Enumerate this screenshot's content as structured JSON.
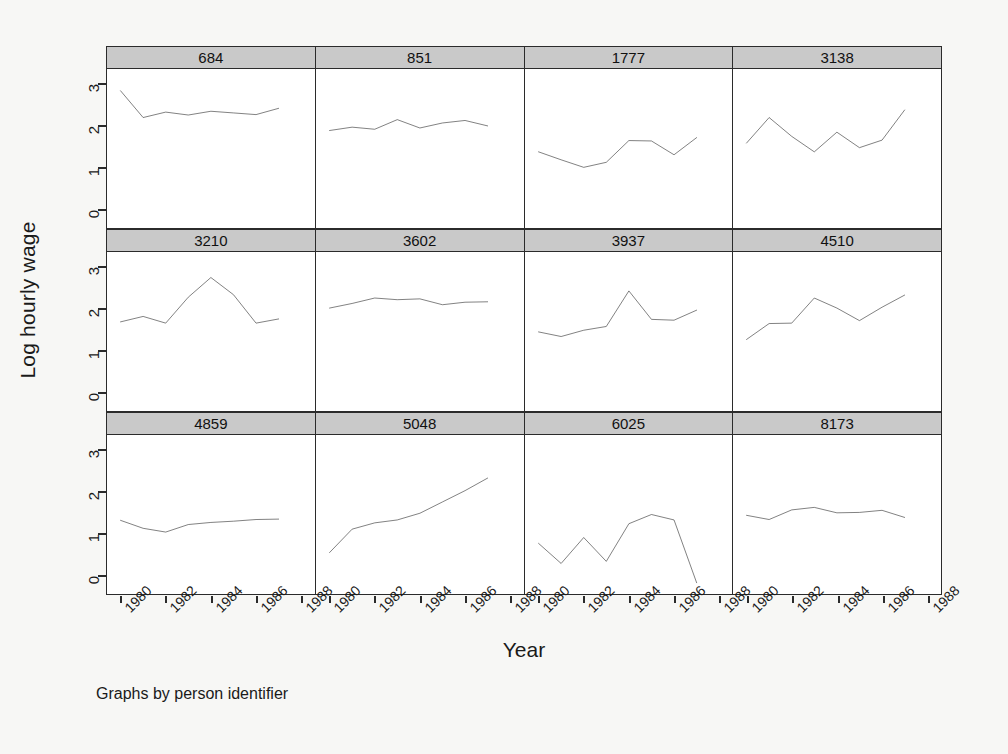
{
  "chart_data": {
    "type": "line",
    "title": "",
    "subtitle": "",
    "caption": "Graphs by person identifier",
    "xlabel": "Year",
    "ylabel": "Log hourly wage",
    "xlim": [
      1979.4,
      1988.6
    ],
    "ylim": [
      -0.45,
      3.35
    ],
    "xticks": [
      1980,
      1982,
      1984,
      1986,
      1988
    ],
    "yticks": [
      0,
      1,
      2,
      3
    ],
    "grid": false,
    "legend": false,
    "facet_by": "person identifier",
    "facet_rows": 3,
    "facet_cols": 4,
    "line_color": "#1a1a1a",
    "strip_color": "#c9c9c9",
    "panels": [
      {
        "label": "684",
        "x": [
          1980,
          1981,
          1982,
          1983,
          1984,
          1985,
          1986,
          1987
        ],
        "y": [
          2.83,
          2.19,
          2.32,
          2.25,
          2.34,
          2.3,
          2.26,
          2.41
        ]
      },
      {
        "label": "851",
        "x": [
          1980,
          1981,
          1982,
          1983,
          1984,
          1985,
          1986,
          1987
        ],
        "y": [
          1.88,
          1.96,
          1.91,
          2.14,
          1.94,
          2.06,
          2.12,
          1.99
        ]
      },
      {
        "label": "1777",
        "x": [
          1980,
          1981,
          1982,
          1983,
          1984,
          1985,
          1986,
          1987
        ],
        "y": [
          1.37,
          1.18,
          1.0,
          1.12,
          1.64,
          1.63,
          1.3,
          1.71
        ]
      },
      {
        "label": "3138",
        "x": [
          1980,
          1981,
          1982,
          1983,
          1984,
          1985,
          1986,
          1987
        ],
        "y": [
          1.58,
          2.19,
          1.74,
          1.37,
          1.84,
          1.47,
          1.65,
          2.37
        ]
      },
      {
        "label": "3210",
        "x": [
          1980,
          1981,
          1982,
          1983,
          1984,
          1985,
          1986,
          1987
        ],
        "y": [
          1.68,
          1.81,
          1.65,
          2.27,
          2.74,
          2.33,
          1.65,
          1.75
        ]
      },
      {
        "label": "3602",
        "x": [
          1980,
          1981,
          1982,
          1983,
          1984,
          1985,
          1986,
          1987
        ],
        "y": [
          2.01,
          2.12,
          2.25,
          2.21,
          2.23,
          2.09,
          2.15,
          2.16
        ]
      },
      {
        "label": "3937",
        "x": [
          1980,
          1981,
          1982,
          1983,
          1984,
          1985,
          1986,
          1987
        ],
        "y": [
          1.44,
          1.33,
          1.48,
          1.57,
          2.42,
          1.74,
          1.72,
          1.96
        ]
      },
      {
        "label": "4510",
        "x": [
          1980,
          1981,
          1982,
          1983,
          1984,
          1985,
          1986,
          1987
        ],
        "y": [
          1.26,
          1.64,
          1.65,
          2.25,
          2.01,
          1.71,
          2.03,
          2.32
        ]
      },
      {
        "label": "4859",
        "x": [
          1980,
          1981,
          1982,
          1983,
          1984,
          1985,
          1986,
          1987
        ],
        "y": [
          1.31,
          1.12,
          1.03,
          1.21,
          1.26,
          1.29,
          1.33,
          1.34
        ]
      },
      {
        "label": "5048",
        "x": [
          1980,
          1981,
          1982,
          1983,
          1984,
          1985,
          1986,
          1987
        ],
        "y": [
          0.54,
          1.1,
          1.25,
          1.32,
          1.48,
          1.75,
          2.02,
          2.32
        ]
      },
      {
        "label": "6025",
        "x": [
          1980,
          1981,
          1982,
          1983,
          1984,
          1985,
          1986,
          1987
        ],
        "y": [
          0.76,
          0.28,
          0.9,
          0.33,
          1.23,
          1.45,
          1.32,
          -0.18
        ]
      },
      {
        "label": "8173",
        "x": [
          1980,
          1981,
          1982,
          1983,
          1984,
          1985,
          1986,
          1987
        ],
        "y": [
          1.43,
          1.33,
          1.56,
          1.62,
          1.49,
          1.5,
          1.55,
          1.38
        ]
      }
    ]
  }
}
